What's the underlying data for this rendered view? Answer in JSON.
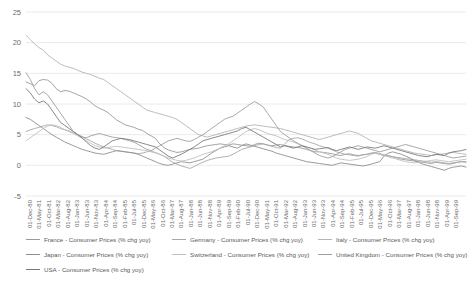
{
  "chart_data": {
    "type": "line",
    "title": "",
    "xlabel": "",
    "ylabel": "",
    "ylim": [
      -5,
      25
    ],
    "yticks": [
      -5,
      0,
      5,
      10,
      15,
      20,
      25
    ],
    "grid": true,
    "legend_position": "bottom",
    "x_tick_labels": [
      "01-Dec-80",
      "01-May-81",
      "01-Oct-81",
      "01-Mar-82",
      "01-Aug-82",
      "01-Jan-83",
      "01-Jun-83",
      "01-Nov-83",
      "01-Apr-84",
      "01-Sep-84",
      "01-Feb-85",
      "01-Jul-85",
      "01-Dec-85",
      "01-May-86",
      "01-Oct-86",
      "01-Mar-87",
      "01-Aug-87",
      "01-Jan-88",
      "01-Jun-88",
      "01-Nov-88",
      "01-Apr-89",
      "01-Sep-89",
      "01-Feb-90",
      "01-Jul-90",
      "01-Dec-90",
      "01-May-91",
      "01-Oct-91",
      "01-Mar-92",
      "01-Aug-92",
      "01-Jan-93",
      "01-Jun-93",
      "01-Nov-93",
      "01-Apr-94",
      "01-Sep-94",
      "01-Feb-95",
      "01-Jul-95",
      "01-Dec-95",
      "01-May-96",
      "01-Oct-96",
      "01-Mar-97",
      "01-Aug-97",
      "01-Jan-98",
      "01-Jun-98",
      "01-Nov-98",
      "01-Apr-99",
      "01-Sep-99"
    ],
    "series": [
      {
        "name": "France - Consumer Prices (% chg yoy)",
        "color": "#9a9a9a",
        "values": [
          13.6,
          13.3,
          13.0,
          13.8,
          14.0,
          13.9,
          13.4,
          12.5,
          12.0,
          12.2,
          12.1,
          11.8,
          11.5,
          11.2,
          10.8,
          10.3,
          9.7,
          9.3,
          9.0,
          8.6,
          8.0,
          7.4,
          7.0,
          6.6,
          6.4,
          6.2,
          5.9,
          5.7,
          5.2,
          4.8,
          4.4,
          3.5,
          2.9,
          2.5,
          2.3,
          2.1,
          2.2,
          2.4,
          2.6,
          2.7,
          2.8,
          3.0,
          3.2,
          3.3,
          3.4,
          3.5,
          3.4,
          3.3,
          3.5,
          3.4,
          3.3,
          3.2,
          3.1,
          3.4,
          3.6,
          3.5,
          3.3,
          3.2,
          3.3,
          3.4,
          3.2,
          3.1,
          3.0,
          2.9,
          2.8,
          2.6,
          2.4,
          2.2,
          2.2,
          2.1,
          2.0,
          1.9,
          1.7,
          1.6,
          1.8,
          1.9,
          1.7,
          1.6,
          1.7,
          1.8,
          2.0,
          2.1,
          1.9,
          1.7,
          1.6,
          1.4,
          1.2,
          1.0,
          0.9,
          0.8,
          0.7,
          0.6,
          0.5,
          0.4,
          0.3,
          0.5,
          0.4,
          0.3,
          0.2,
          0.3,
          0.5,
          0.6,
          0.5
        ]
      },
      {
        "name": "Germany - Consumer Prices (% chg yoy)",
        "color": "#a8a8a8",
        "values": [
          5.5,
          5.8,
          6.0,
          6.2,
          6.4,
          6.6,
          6.5,
          6.3,
          6.0,
          5.8,
          5.6,
          5.3,
          5.0,
          4.7,
          4.3,
          4.0,
          3.6,
          3.3,
          3.0,
          2.8,
          2.6,
          2.4,
          2.3,
          2.2,
          2.1,
          2.0,
          1.9,
          2.0,
          2.2,
          2.3,
          2.1,
          1.8,
          1.5,
          1.0,
          0.5,
          0.2,
          -0.1,
          -0.3,
          -0.5,
          -0.2,
          0.2,
          0.5,
          0.8,
          1.0,
          1.2,
          1.3,
          1.4,
          1.5,
          1.8,
          2.2,
          2.6,
          2.8,
          3.0,
          3.2,
          3.4,
          3.5,
          3.3,
          3.1,
          2.9,
          2.8,
          3.5,
          4.2,
          4.4,
          4.5,
          4.3,
          4.0,
          3.7,
          3.5,
          3.2,
          3.0,
          2.8,
          2.5,
          2.2,
          2.0,
          1.8,
          1.7,
          1.6,
          1.5,
          1.7,
          1.8,
          1.9,
          2.0,
          1.8,
          1.6,
          1.5,
          1.4,
          1.3,
          1.2,
          1.1,
          1.0,
          0.9,
          0.8,
          0.7,
          0.6,
          0.5,
          0.6,
          0.5,
          0.4,
          0.3,
          0.4,
          0.5,
          0.6,
          0.6
        ]
      },
      {
        "name": "Italy - Consumer Prices (% chg yoy)",
        "color": "#b4b4b4",
        "values": [
          21.2,
          20.5,
          19.8,
          19.2,
          18.8,
          18.0,
          17.5,
          17.0,
          16.5,
          16.2,
          16.0,
          15.8,
          15.5,
          15.2,
          15.0,
          14.8,
          14.5,
          14.2,
          14.0,
          13.5,
          13.0,
          12.5,
          12.0,
          11.5,
          11.0,
          10.5,
          10.0,
          9.5,
          9.0,
          8.8,
          8.6,
          8.4,
          8.2,
          8.0,
          7.8,
          7.5,
          7.0,
          6.5,
          6.0,
          5.5,
          5.0,
          4.8,
          4.6,
          4.8,
          5.0,
          5.2,
          5.4,
          5.6,
          5.8,
          6.0,
          6.2,
          6.4,
          6.5,
          6.6,
          6.5,
          6.4,
          6.3,
          6.2,
          6.1,
          6.0,
          5.8,
          5.6,
          5.4,
          5.2,
          5.0,
          4.8,
          4.6,
          4.4,
          4.2,
          4.4,
          4.6,
          4.8,
          5.0,
          5.2,
          5.4,
          5.6,
          5.4,
          5.2,
          4.8,
          4.4,
          4.0,
          3.8,
          3.6,
          3.4,
          3.2,
          3.0,
          2.8,
          2.6,
          2.4,
          2.2,
          2.0,
          1.9,
          1.8,
          1.7,
          1.6,
          1.7,
          1.8,
          1.9,
          2.0,
          2.1,
          2.0,
          1.9,
          1.8
        ]
      },
      {
        "name": "Japan - Consumer Prices (% chg yoy)",
        "color": "#8f8f8f",
        "values": [
          7.8,
          7.5,
          7.0,
          6.5,
          6.0,
          5.5,
          5.0,
          4.6,
          4.2,
          3.8,
          3.5,
          3.2,
          2.9,
          2.6,
          2.4,
          2.2,
          2.0,
          1.9,
          1.8,
          2.0,
          2.2,
          2.4,
          2.3,
          2.2,
          2.1,
          2.0,
          1.8,
          1.5,
          1.2,
          0.9,
          0.6,
          0.3,
          0.1,
          0.0,
          0.2,
          0.4,
          0.6,
          0.5,
          0.4,
          0.6,
          0.8,
          1.0,
          1.5,
          2.0,
          2.4,
          2.8,
          3.0,
          3.2,
          3.0,
          2.8,
          3.2,
          3.5,
          3.3,
          3.1,
          2.9,
          2.7,
          2.5,
          2.3,
          2.0,
          1.8,
          1.6,
          1.4,
          1.2,
          1.0,
          0.8,
          0.6,
          0.5,
          0.4,
          0.3,
          0.2,
          0.1,
          0.0,
          0.2,
          0.4,
          0.3,
          0.2,
          0.1,
          0.0,
          -0.1,
          0.0,
          0.2,
          0.4,
          0.6,
          1.5,
          2.0,
          2.2,
          2.0,
          1.8,
          1.5,
          1.2,
          0.8,
          0.5,
          0.2,
          0.0,
          -0.2,
          -0.4,
          -0.6,
          -0.8,
          -0.5,
          -0.3,
          -0.2,
          -0.1,
          -0.3
        ]
      },
      {
        "name": "Switzerland - Consumer Prices (% chg yoy)",
        "color": "#c0c0c0",
        "values": [
          4.0,
          4.5,
          5.0,
          5.5,
          6.0,
          6.4,
          6.6,
          6.5,
          6.2,
          5.8,
          5.5,
          5.2,
          4.8,
          4.4,
          4.0,
          3.6,
          3.2,
          3.0,
          2.8,
          2.9,
          3.0,
          3.1,
          3.0,
          2.9,
          2.8,
          2.7,
          2.6,
          2.5,
          2.4,
          2.2,
          2.0,
          1.8,
          1.5,
          1.2,
          1.0,
          0.8,
          0.7,
          0.8,
          1.0,
          1.2,
          1.5,
          1.8,
          2.0,
          2.2,
          2.5,
          2.8,
          3.2,
          3.5,
          4.0,
          4.5,
          5.0,
          5.5,
          5.8,
          6.0,
          5.8,
          5.5,
          5.2,
          5.0,
          4.8,
          4.5,
          4.2,
          4.0,
          3.8,
          3.5,
          3.2,
          3.0,
          2.8,
          2.5,
          2.2,
          2.0,
          1.8,
          1.5,
          1.2,
          1.0,
          0.9,
          0.8,
          0.9,
          1.0,
          1.2,
          1.4,
          1.8,
          2.0,
          1.8,
          1.6,
          1.4,
          1.2,
          1.0,
          0.8,
          0.6,
          0.5,
          0.4,
          0.5,
          0.6,
          0.7,
          0.8,
          0.9,
          0.8,
          0.7,
          0.6,
          0.7,
          0.8,
          0.9,
          1.0
        ]
      },
      {
        "name": "United Kingdom - Consumer Prices (% chg yoy)",
        "color": "#9e9e9e",
        "values": [
          15.1,
          14.0,
          12.5,
          11.5,
          12.0,
          11.5,
          10.5,
          9.5,
          8.5,
          7.5,
          6.5,
          5.5,
          5.0,
          4.6,
          4.5,
          4.8,
          5.0,
          5.2,
          5.0,
          4.8,
          4.6,
          4.5,
          4.4,
          4.2,
          4.0,
          3.8,
          3.4,
          3.0,
          2.6,
          2.4,
          2.8,
          3.2,
          3.6,
          4.0,
          4.2,
          4.4,
          4.2,
          4.0,
          3.9,
          4.2,
          4.6,
          5.0,
          5.5,
          6.0,
          6.5,
          7.0,
          7.5,
          7.8,
          8.0,
          8.5,
          9.0,
          9.5,
          10.0,
          10.4,
          10.0,
          9.5,
          8.5,
          7.5,
          6.5,
          5.5,
          5.0,
          4.5,
          4.0,
          3.6,
          3.2,
          2.8,
          2.4,
          2.0,
          1.6,
          1.4,
          1.2,
          1.4,
          1.8,
          2.2,
          2.6,
          2.8,
          3.0,
          3.2,
          3.0,
          2.8,
          2.6,
          2.4,
          2.2,
          2.4,
          2.6,
          2.8,
          3.0,
          3.2,
          3.4,
          3.2,
          3.0,
          2.8,
          2.6,
          2.4,
          2.2,
          2.0,
          1.8,
          1.6,
          1.4,
          1.2,
          1.3,
          1.4,
          1.5
        ]
      },
      {
        "name": "USA - Consumer Prices (% chg yoy)",
        "color": "#7a7a7a",
        "values": [
          12.5,
          11.8,
          10.8,
          10.2,
          10.5,
          10.0,
          9.0,
          8.0,
          7.0,
          6.5,
          6.0,
          5.5,
          5.0,
          4.5,
          3.8,
          3.2,
          2.8,
          2.6,
          3.0,
          3.5,
          4.0,
          4.2,
          4.4,
          4.3,
          4.2,
          4.0,
          3.8,
          3.6,
          3.4,
          3.2,
          3.0,
          2.5,
          2.0,
          1.5,
          1.2,
          1.5,
          1.8,
          2.2,
          2.6,
          3.0,
          3.5,
          4.0,
          4.2,
          4.4,
          4.6,
          4.8,
          5.0,
          5.2,
          5.4,
          5.6,
          6.0,
          6.2,
          5.8,
          5.4,
          5.0,
          4.6,
          4.2,
          3.8,
          3.4,
          3.0,
          3.2,
          3.0,
          2.8,
          3.0,
          3.2,
          3.0,
          2.8,
          2.6,
          2.7,
          2.8,
          2.9,
          2.6,
          2.4,
          2.6,
          2.8,
          3.0,
          2.8,
          2.6,
          2.8,
          3.0,
          2.9,
          2.8,
          3.0,
          3.2,
          3.0,
          2.8,
          2.6,
          2.4,
          2.2,
          2.0,
          1.8,
          1.6,
          1.5,
          1.4,
          1.6,
          1.8,
          1.7,
          1.6,
          2.0,
          2.2,
          2.3,
          2.4,
          2.6
        ]
      }
    ],
    "legend": [
      {
        "label": "France - Consumer Prices (% chg yoy)",
        "color": "#9a9a9a"
      },
      {
        "label": "Germany - Consumer Prices (% chg yoy)",
        "color": "#a8a8a8"
      },
      {
        "label": "Italy - Consumer Prices (% chg yoy)",
        "color": "#b4b4b4"
      },
      {
        "label": "Japan - Consumer Prices (% chg yoy)",
        "color": "#8f8f8f"
      },
      {
        "label": "Switzerland - Consumer Prices (% chg yoy)",
        "color": "#c0c0c0"
      },
      {
        "label": "United Kingdom - Consumer Prices (% chg yoy)",
        "color": "#9e9e9e"
      },
      {
        "label": "USA - Consumer Prices (% chg yoy)",
        "color": "#7a7a7a"
      }
    ]
  }
}
